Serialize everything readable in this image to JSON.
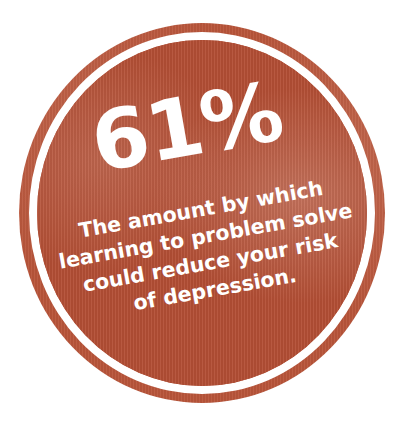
{
  "badge": {
    "stat": "61%",
    "caption_lines": [
      "The amount by which",
      "learning to problem solve",
      "could reduce your risk",
      "of depression."
    ],
    "colors": {
      "fill": "#b44f35",
      "ring": "#b9553a",
      "text": "#ffffff",
      "background": "#ffffff"
    }
  }
}
